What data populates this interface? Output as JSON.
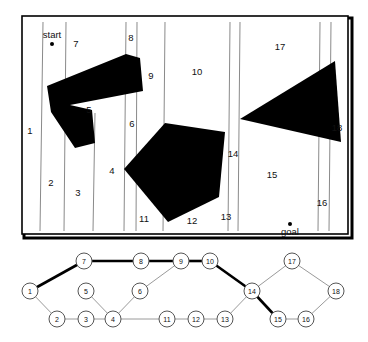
{
  "figure": {
    "title": "",
    "map": {
      "border_color": "#000000",
      "background": "#ffffff",
      "line_color": "#8a8a8a",
      "obstacle_color": "#000000",
      "markers": [
        {
          "name": "start",
          "label": "start",
          "x": 52,
          "y": 44
        },
        {
          "name": "goal",
          "label": "goal",
          "x": 290,
          "y": 224
        }
      ],
      "cells": [
        {
          "id": "1",
          "label": "1",
          "x": 30,
          "y": 134
        },
        {
          "id": "2",
          "label": "2",
          "x": 51,
          "y": 186
        },
        {
          "id": "3",
          "label": "3",
          "x": 78,
          "y": 196
        },
        {
          "id": "4",
          "label": "4",
          "x": 112,
          "y": 174
        },
        {
          "id": "5",
          "label": "5",
          "x": 89,
          "y": 113
        },
        {
          "id": "6",
          "label": "6",
          "x": 132,
          "y": 127
        },
        {
          "id": "7",
          "label": "7",
          "x": 76,
          "y": 47
        },
        {
          "id": "8",
          "label": "8",
          "x": 131,
          "y": 41
        },
        {
          "id": "9",
          "label": "9",
          "x": 151,
          "y": 79
        },
        {
          "id": "10",
          "label": "10",
          "x": 197,
          "y": 75
        },
        {
          "id": "11",
          "label": "11",
          "x": 144,
          "y": 222
        },
        {
          "id": "12",
          "label": "12",
          "x": 192,
          "y": 224
        },
        {
          "id": "13",
          "label": "13",
          "x": 226,
          "y": 220
        },
        {
          "id": "14",
          "label": "14",
          "x": 233,
          "y": 157
        },
        {
          "id": "15",
          "label": "15",
          "x": 272,
          "y": 178
        },
        {
          "id": "16",
          "label": "16",
          "x": 322,
          "y": 206
        },
        {
          "id": "17",
          "label": "17",
          "x": 280,
          "y": 50
        },
        {
          "id": "18",
          "label": "18",
          "x": 337,
          "y": 131
        }
      ],
      "vertical_lines": [
        {
          "name": "line-a",
          "x1": 43,
          "y1": 22,
          "x2": 40,
          "y2": 231
        },
        {
          "name": "line-b",
          "x1": 66,
          "y1": 22,
          "x2": 64,
          "y2": 231
        },
        {
          "name": "line-c",
          "x1": 95,
          "y1": 113,
          "x2": 93,
          "y2": 231
        },
        {
          "name": "line-d",
          "x1": 126,
          "y1": 22,
          "x2": 124,
          "y2": 231
        },
        {
          "name": "line-e",
          "x1": 137,
          "y1": 22,
          "x2": 136,
          "y2": 231
        },
        {
          "name": "line-f",
          "x1": 165,
          "y1": 22,
          "x2": 163,
          "y2": 231
        },
        {
          "name": "line-g",
          "x1": 230,
          "y1": 22,
          "x2": 228,
          "y2": 231
        },
        {
          "name": "line-h",
          "x1": 240,
          "y1": 22,
          "x2": 238,
          "y2": 231
        },
        {
          "name": "line-i",
          "x1": 320,
          "y1": 22,
          "x2": 318,
          "y2": 231
        },
        {
          "name": "line-j",
          "x1": 331,
          "y1": 22,
          "x2": 329,
          "y2": 231
        }
      ],
      "obstacles": [
        {
          "name": "obstacle-L-shape",
          "points": "126,54 47,86 51,112 75,148 95,143 92,110 70,105 143,91 140,58"
        },
        {
          "name": "obstacle-pentagon",
          "points": "165,123 124,169 168,222 219,197 225,132"
        },
        {
          "name": "obstacle-triangle",
          "points": "240,119 335,61 341,142"
        }
      ]
    },
    "graph": {
      "node_fill": "#ffffff",
      "node_stroke": "#555555",
      "edge_color": "#9a9a9a",
      "path_color": "#000000",
      "nodes": [
        {
          "id": "1",
          "label": "1",
          "x": 30,
          "y": 291
        },
        {
          "id": "2",
          "label": "2",
          "x": 57,
          "y": 319
        },
        {
          "id": "3",
          "label": "3",
          "x": 86,
          "y": 319
        },
        {
          "id": "4",
          "label": "4",
          "x": 113,
          "y": 319
        },
        {
          "id": "5",
          "label": "5",
          "x": 86,
          "y": 291
        },
        {
          "id": "6",
          "label": "6",
          "x": 140,
          "y": 291
        },
        {
          "id": "7",
          "label": "7",
          "x": 84,
          "y": 261
        },
        {
          "id": "8",
          "label": "8",
          "x": 141,
          "y": 261
        },
        {
          "id": "9",
          "label": "9",
          "x": 181,
          "y": 261
        },
        {
          "id": "10",
          "label": "10",
          "x": 210,
          "y": 261
        },
        {
          "id": "11",
          "label": "11",
          "x": 167,
          "y": 319
        },
        {
          "id": "12",
          "label": "12",
          "x": 196,
          "y": 319
        },
        {
          "id": "13",
          "label": "13",
          "x": 225,
          "y": 319
        },
        {
          "id": "14",
          "label": "14",
          "x": 252,
          "y": 291
        },
        {
          "id": "15",
          "label": "15",
          "x": 278,
          "y": 319
        },
        {
          "id": "16",
          "label": "16",
          "x": 306,
          "y": 319
        },
        {
          "id": "17",
          "label": "17",
          "x": 292,
          "y": 261
        },
        {
          "id": "18",
          "label": "18",
          "x": 336,
          "y": 291
        }
      ],
      "node_radius": 8,
      "edges": [
        {
          "from": "1",
          "to": "7",
          "highlighted": true
        },
        {
          "from": "7",
          "to": "8",
          "highlighted": true
        },
        {
          "from": "8",
          "to": "9",
          "highlighted": true
        },
        {
          "from": "9",
          "to": "10",
          "highlighted": true
        },
        {
          "from": "10",
          "to": "14",
          "highlighted": true
        },
        {
          "from": "14",
          "to": "15",
          "highlighted": true
        },
        {
          "from": "1",
          "to": "2",
          "highlighted": false
        },
        {
          "from": "2",
          "to": "3",
          "highlighted": false
        },
        {
          "from": "3",
          "to": "4",
          "highlighted": false
        },
        {
          "from": "4",
          "to": "5",
          "highlighted": false
        },
        {
          "from": "4",
          "to": "6",
          "highlighted": false
        },
        {
          "from": "6",
          "to": "9",
          "highlighted": false
        },
        {
          "from": "4",
          "to": "11",
          "highlighted": false
        },
        {
          "from": "11",
          "to": "12",
          "highlighted": false
        },
        {
          "from": "12",
          "to": "13",
          "highlighted": false
        },
        {
          "from": "13",
          "to": "14",
          "highlighted": false
        },
        {
          "from": "14",
          "to": "17",
          "highlighted": false
        },
        {
          "from": "17",
          "to": "18",
          "highlighted": false
        },
        {
          "from": "18",
          "to": "16",
          "highlighted": false
        },
        {
          "from": "16",
          "to": "15",
          "highlighted": false
        }
      ],
      "highlighted_path": [
        "1",
        "7",
        "8",
        "9",
        "10",
        "14",
        "15"
      ]
    }
  }
}
